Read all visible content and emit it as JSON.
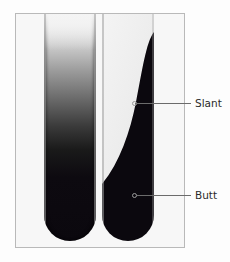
{
  "figure": {
    "tubes": [
      {
        "id": "left",
        "description": "Agar tube with dark gradient from bottom fading upward"
      },
      {
        "id": "right",
        "description": "Agar slant tube with white diagonal slant surface over dark butt"
      }
    ],
    "labels": [
      {
        "text": "Slant",
        "target": "right tube slant region"
      },
      {
        "text": "Butt",
        "target": "right tube butt region"
      }
    ]
  },
  "colors": {
    "medium_dark": "#0b080e",
    "slant_light": "#f2f2f2",
    "frame_border": "#b9b9b9",
    "callout_line": "#6b6b6b",
    "label_text": "#2a2a2a"
  }
}
